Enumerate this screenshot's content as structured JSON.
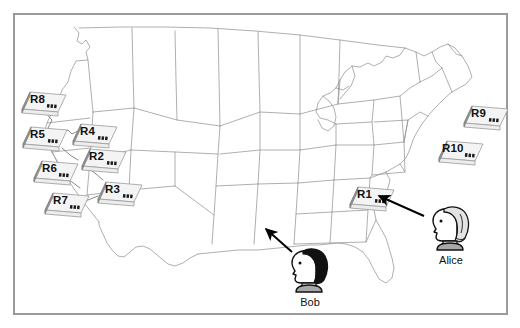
{
  "diagram": {
    "map_region": "United States (contiguous 48 states outline)",
    "frame": {
      "border_color": "#9a9a9a",
      "background": "#ffffff"
    },
    "routers": [
      {
        "id": "R1",
        "label": "R1",
        "x": 345,
        "y": 184,
        "icon": "router-icon"
      },
      {
        "id": "R2",
        "label": "R2",
        "x": 77,
        "y": 146,
        "icon": "router-icon"
      },
      {
        "id": "R3",
        "label": "R3",
        "x": 93,
        "y": 179,
        "icon": "router-icon"
      },
      {
        "id": "R4",
        "label": "R4",
        "x": 68,
        "y": 121,
        "icon": "router-icon"
      },
      {
        "id": "R5",
        "label": "R5",
        "x": 18,
        "y": 124,
        "icon": "router-icon"
      },
      {
        "id": "R6",
        "label": "R6",
        "x": 29,
        "y": 158,
        "icon": "router-icon"
      },
      {
        "id": "R7",
        "label": "R7",
        "x": 40,
        "y": 190,
        "icon": "router-icon"
      },
      {
        "id": "R8",
        "label": "R8",
        "x": 17,
        "y": 89,
        "icon": "router-icon"
      },
      {
        "id": "R9",
        "label": "R9",
        "x": 459,
        "y": 103,
        "icon": "router-icon"
      },
      {
        "id": "R10",
        "label": "R10",
        "x": 434,
        "y": 138,
        "icon": "router-icon"
      }
    ],
    "people": [
      {
        "id": "bob",
        "label": "Bob",
        "hair": "dark",
        "hair_color": "#111111",
        "x": 283,
        "y": 246,
        "points_to": "texas-region",
        "icon": "person-bust-icon"
      },
      {
        "id": "alice",
        "label": "Alice",
        "hair": "light",
        "hair_color": "#e3e3e3",
        "x": 430,
        "y": 204,
        "points_to": "R1",
        "icon": "person-bust-icon"
      }
    ],
    "arrows": [
      {
        "from": "bob",
        "to": "texas-region",
        "head": "arrow-head"
      },
      {
        "from": "alice",
        "to": "R1",
        "head": "arrow-head"
      }
    ],
    "links": [
      "R8-R5",
      "R5-R4",
      "R4-R2",
      "R2-R3",
      "R6-R3",
      "R6-R7",
      "R7-R3",
      "R2-R6"
    ],
    "colors": {
      "map_outline": "#8c8c8c",
      "router_body": "#f2f2f2",
      "router_shadow": "#8f8f8f",
      "router_port": "#1a1a1a",
      "arrow": "#000000",
      "text": "#111111"
    }
  }
}
